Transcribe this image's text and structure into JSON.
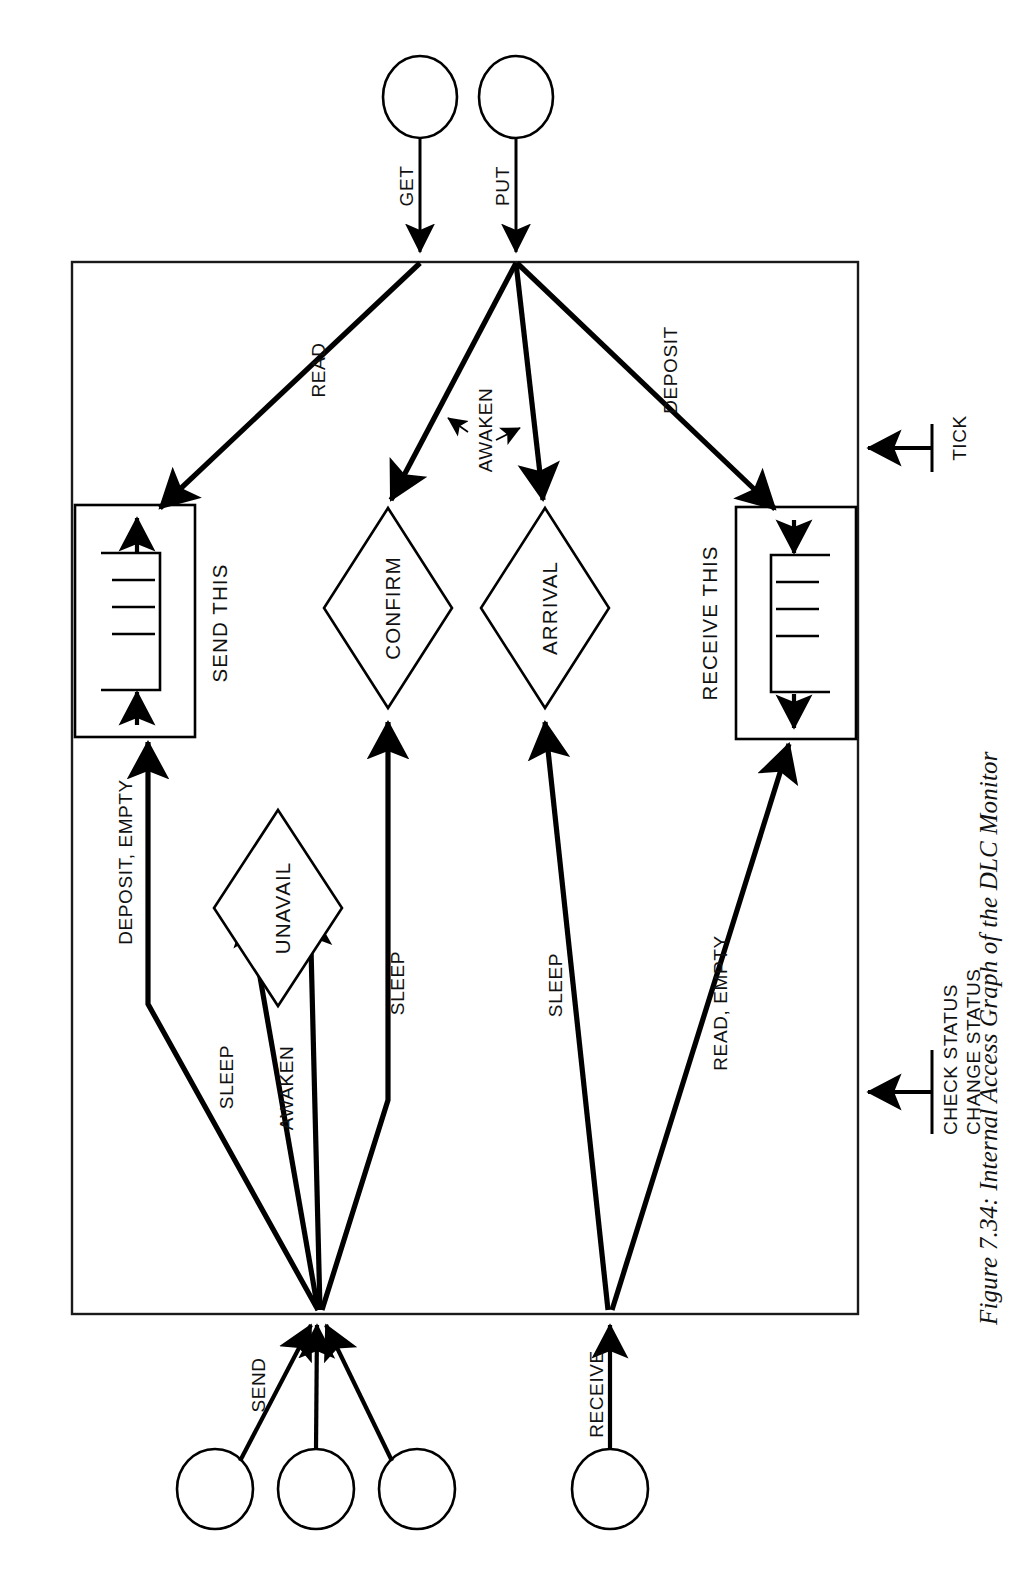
{
  "figure": {
    "caption": "Figure 7.34: Internal Access Graph of the DLC Monitor",
    "orientation": "rotated-90-ccw"
  },
  "monitor": {
    "name": "DLC Monitor",
    "border_color": "#1a1a1a"
  },
  "external_entities": [
    {
      "id": "get-caller",
      "port_label": "GET",
      "side": "top"
    },
    {
      "id": "put-caller",
      "port_label": "PUT",
      "side": "top"
    },
    {
      "id": "send-caller-1",
      "port_label": "SEND",
      "side": "bottom"
    },
    {
      "id": "send-caller-2",
      "port_label": "",
      "side": "bottom"
    },
    {
      "id": "send-caller-3",
      "port_label": "",
      "side": "bottom"
    },
    {
      "id": "receive-caller",
      "port_label": "RECEIVE",
      "side": "bottom"
    }
  ],
  "entry_ports": [
    {
      "id": "get-port",
      "label": "GET"
    },
    {
      "id": "put-port",
      "label": "PUT"
    },
    {
      "id": "send-port",
      "label": "SEND"
    },
    {
      "id": "receive-port",
      "label": "RECEIVE"
    },
    {
      "id": "tick-port",
      "label": "TICK"
    },
    {
      "id": "status-port",
      "label_line_1": "CHECK STATUS",
      "label_line_2": "CHANGE STATUS"
    }
  ],
  "nodes": [
    {
      "id": "send-this",
      "label": "SEND THIS",
      "shape": "queue-box"
    },
    {
      "id": "receive-this",
      "label": "RECEIVE THIS",
      "shape": "queue-box"
    },
    {
      "id": "confirm",
      "label": "CONFIRM",
      "shape": "diamond"
    },
    {
      "id": "arrival",
      "label": "ARRIVAL",
      "shape": "diamond"
    },
    {
      "id": "unavail",
      "label": "UNAVAIL",
      "shape": "diamond"
    }
  ],
  "edges": [
    {
      "id": "e-read",
      "from": "get-port",
      "to": "send-this",
      "label": "READ"
    },
    {
      "id": "e-awaken-confirm",
      "from": "put-port",
      "to": "confirm",
      "label": "AWAKEN"
    },
    {
      "id": "e-awaken-arrival",
      "from": "put-port",
      "to": "arrival",
      "label": "AWAKEN"
    },
    {
      "id": "e-deposit",
      "from": "put-port",
      "to": "receive-this",
      "label": "DEPOSIT"
    },
    {
      "id": "e-deposit-empty",
      "from": "send-port",
      "to": "send-this",
      "label": "DEPOSIT, EMPTY"
    },
    {
      "id": "e-sleep-unavail",
      "from": "send-port",
      "to": "unavail",
      "label": "SLEEP"
    },
    {
      "id": "e-awaken-unavail",
      "from": "send-port",
      "to": "unavail",
      "label": "AWAKEN"
    },
    {
      "id": "e-sleep-confirm",
      "from": "send-port",
      "to": "confirm",
      "label": "SLEEP"
    },
    {
      "id": "e-sleep-arrival",
      "from": "receive-port",
      "to": "arrival",
      "label": "SLEEP"
    },
    {
      "id": "e-read-empty",
      "from": "receive-port",
      "to": "receive-this",
      "label": "READ, EMPTY"
    }
  ],
  "edge_labels": {
    "read": "READ",
    "awaken": "AWAKEN",
    "deposit": "DEPOSIT",
    "deposit_empty": "DEPOSIT, EMPTY",
    "sleep": "SLEEP",
    "awaken_unavail": "AWAKEN",
    "sleep_confirm": "SLEEP",
    "sleep_arrival": "SLEEP",
    "read_empty": "READ, EMPTY"
  },
  "port_labels": {
    "get": "GET",
    "put": "PUT",
    "send": "SEND",
    "receive": "RECEIVE",
    "tick": "TICK",
    "check_status": "CHECK STATUS",
    "change_status": "CHANGE STATUS"
  },
  "node_labels": {
    "send_this": "SEND THIS",
    "receive_this": "RECEIVE THIS",
    "confirm": "CONFIRM",
    "arrival": "ARRIVAL",
    "unavail": "UNAVAIL"
  },
  "colors": {
    "ink": "#000000",
    "paper": "#ffffff",
    "border": "#1a1a1a"
  }
}
